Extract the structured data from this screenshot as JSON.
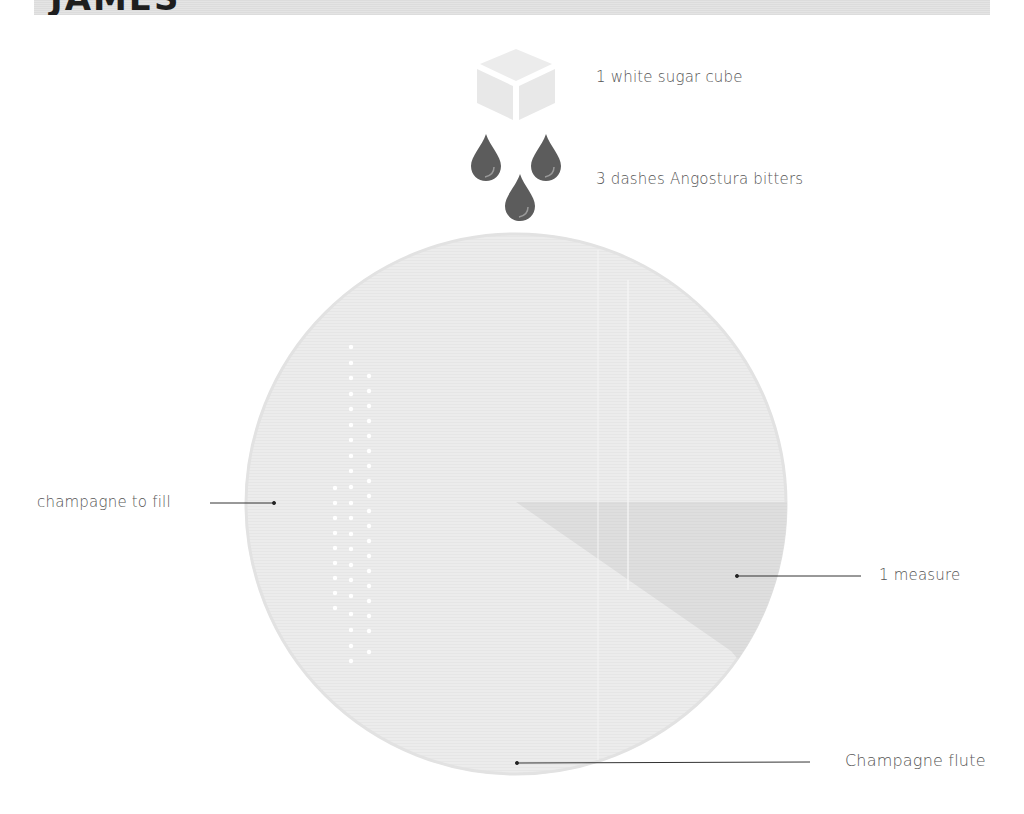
{
  "header": {
    "title": "JAMES",
    "bar_color": "#e0e0e0"
  },
  "ingredients": [
    {
      "id": "sugar",
      "label": "1 white sugar cube",
      "icon": "sugar-cube-icon"
    },
    {
      "id": "bitters",
      "label": "3 dashes Angostura bitters",
      "icon": "drops-icon",
      "drop_count": 3,
      "drop_color": "#5c5c5c"
    },
    {
      "id": "champagne",
      "label": "champagne to fill"
    },
    {
      "id": "measure",
      "label": "1 measure"
    }
  ],
  "glass": {
    "label": "Champagne flute",
    "fill_color": "#ececec",
    "measure_color": "#dedede"
  },
  "colors": {
    "text": "#555555",
    "leader_line": "#333333",
    "cube": "#ebebeb",
    "bubble": "#ffffff"
  }
}
